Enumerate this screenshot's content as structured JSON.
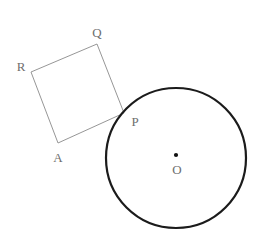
{
  "figure": {
    "background_color": "#ffffff",
    "width": 261,
    "height": 250
  },
  "style": {
    "square_stroke_color": "#8a8a8a",
    "square_stroke_width": 0.9,
    "circle_stroke_color": "#1b1b1b",
    "circle_stroke_width": 2.2,
    "label_color": "#6e6e6e",
    "center_dot_color": "#111111",
    "fill": "none"
  },
  "circle": {
    "name": "circle-O",
    "center": {
      "x": 176,
      "y": 158
    },
    "radius": 70,
    "center_dot_radius": 2.1,
    "center_dot": {
      "x": 176,
      "y": 155
    }
  },
  "square": {
    "name": "square-PQRA",
    "vertices": [
      {
        "id": "Q",
        "x": 97,
        "y": 44
      },
      {
        "id": "R",
        "x": 31,
        "y": 72
      },
      {
        "id": "A",
        "x": 58,
        "y": 143
      },
      {
        "id": "P",
        "x": 124,
        "y": 113
      }
    ],
    "path": "M 97,44 L 31,72 L 58,143 L 124,113 Z"
  },
  "labels": [
    {
      "id": "Q",
      "text": "Q",
      "x": 97,
      "y": 32,
      "name": "vertex-label-Q"
    },
    {
      "id": "R",
      "text": "R",
      "x": 21,
      "y": 66,
      "name": "vertex-label-R"
    },
    {
      "id": "A",
      "text": "A",
      "x": 58,
      "y": 157,
      "name": "vertex-label-A"
    },
    {
      "id": "P",
      "text": "P",
      "x": 135,
      "y": 121,
      "name": "vertex-label-P"
    },
    {
      "id": "O",
      "text": "O",
      "x": 177,
      "y": 169,
      "name": "center-label-O"
    }
  ]
}
